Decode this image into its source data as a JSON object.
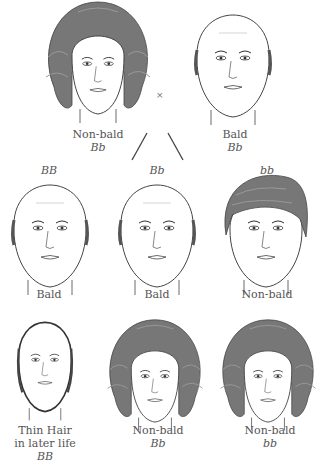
{
  "parents": {
    "mother": {
      "phenotype": "Non-bald",
      "genotype": "Bb",
      "sex": "female"
    },
    "father": {
      "phenotype": "Bald",
      "genotype": "Bb",
      "sex": "male"
    },
    "cross_symbol": "×"
  },
  "sons": [
    {
      "genotype": "BB",
      "phenotype": "Bald"
    },
    {
      "genotype": "Bb",
      "phenotype": "Bald"
    },
    {
      "genotype": "bb",
      "phenotype": "Non-bald"
    }
  ],
  "daughters": [
    {
      "phenotype_line1": "Thin Hair",
      "phenotype_line2": "in later life",
      "genotype": "BB"
    },
    {
      "phenotype": "Non-bald",
      "genotype": "Bb"
    },
    {
      "phenotype": "Non-bald",
      "genotype": "bb"
    }
  ],
  "colors": {
    "hair": "#777777",
    "line": "#444444",
    "background": "#ffffff"
  }
}
